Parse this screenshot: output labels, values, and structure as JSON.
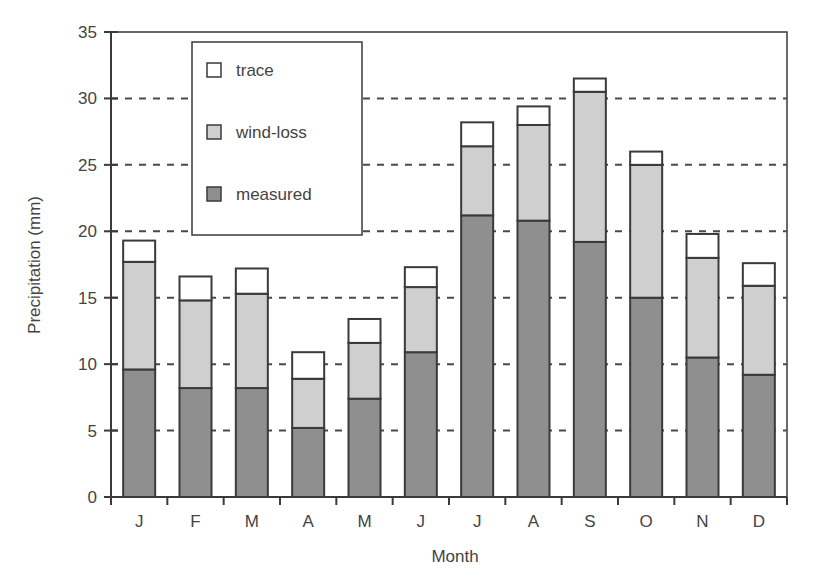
{
  "chart_data": {
    "type": "bar",
    "stacked": true,
    "title": "",
    "xlabel": "Month",
    "ylabel": "Precipitation (mm)",
    "ylim": [
      0,
      35
    ],
    "yticks": [
      0,
      5,
      10,
      15,
      20,
      25,
      30,
      35
    ],
    "grid": "horizontal dashed",
    "legend_position": "upper left (inside)",
    "categories": [
      "J",
      "F",
      "M",
      "A",
      "M",
      "J",
      "J",
      "A",
      "S",
      "O",
      "N",
      "D"
    ],
    "series": [
      {
        "name": "measured",
        "color": "#8f8f8f",
        "values": [
          9.6,
          8.2,
          8.2,
          5.2,
          7.4,
          10.9,
          21.2,
          20.8,
          19.2,
          15.0,
          10.5,
          9.2
        ]
      },
      {
        "name": "wind-loss",
        "color": "#cfcfcf",
        "values": [
          8.1,
          6.6,
          7.1,
          3.7,
          4.2,
          4.9,
          5.2,
          7.2,
          11.3,
          10.0,
          7.5,
          6.7
        ]
      },
      {
        "name": "trace",
        "color": "#ffffff",
        "values": [
          1.6,
          1.8,
          1.9,
          2.0,
          1.8,
          1.5,
          1.8,
          1.4,
          1.0,
          1.0,
          1.8,
          1.7
        ]
      }
    ],
    "totals": [
      19.3,
      16.6,
      17.2,
      10.9,
      13.4,
      17.3,
      28.2,
      29.4,
      31.5,
      26.0,
      19.8,
      17.6
    ]
  },
  "legend": {
    "items": [
      {
        "label": "trace",
        "color": "#ffffff"
      },
      {
        "label": "wind-loss",
        "color": "#cfcfcf"
      },
      {
        "label": "measured",
        "color": "#8f8f8f"
      }
    ]
  },
  "colors": {
    "axis": "#3a3a3a",
    "grid": "#4a4a4a",
    "bar_outline": "#3a3a3a"
  }
}
